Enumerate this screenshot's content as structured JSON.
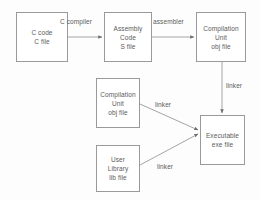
{
  "diagram": {
    "background_color": "#fdfdfd",
    "stroke_color": "#9a9a9a",
    "text_color": "#5b5b5b",
    "nodes": [
      {
        "id": "c-source",
        "lines": [
          "C code",
          "C file"
        ],
        "line1": "C code",
        "line2": "C file"
      },
      {
        "id": "assembly-code",
        "lines": [
          "Assembly",
          "Code",
          "S file"
        ],
        "line1": "Assembly",
        "line2": "Code",
        "line3": "S file"
      },
      {
        "id": "compilation-unit-top",
        "lines": [
          "Compilation",
          "Unit",
          "obj file"
        ],
        "line1": "Compilation",
        "line2": "Unit",
        "line3": "obj file"
      },
      {
        "id": "compilation-unit-mid",
        "lines": [
          "Compilation",
          "Unit",
          "obj file"
        ],
        "line1": "Compilation",
        "line2": "Unit",
        "line3": "obj file"
      },
      {
        "id": "user-library",
        "lines": [
          "User",
          "Library",
          "lib file"
        ],
        "line1": "User",
        "line2": "Library",
        "line3": "lib file"
      },
      {
        "id": "executable",
        "lines": [
          "Executable",
          "exe file"
        ],
        "line1": "Executable",
        "line2": "exe file"
      }
    ],
    "edges": [
      {
        "id": "c-compiler",
        "label": "C compiler",
        "from": "c-source",
        "to": "assembly-code"
      },
      {
        "id": "assembler",
        "label": "assembler",
        "from": "assembly-code",
        "to": "compilation-unit-top"
      },
      {
        "id": "linker-vertical",
        "label": "linker",
        "from": "compilation-unit-top",
        "to": "executable"
      },
      {
        "id": "linker-upper-diagonal",
        "label": "linker",
        "from": "compilation-unit-mid",
        "to": "executable"
      },
      {
        "id": "linker-lower-diagonal",
        "label": "linker",
        "from": "user-library",
        "to": "executable"
      }
    ]
  }
}
